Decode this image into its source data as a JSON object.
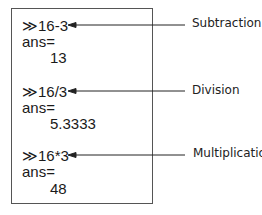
{
  "blocks": [
    {
      "command": "≫16-3",
      "ans_label": "ans=",
      "value": "13",
      "annotation": "Subtraction"
    },
    {
      "command": "≫16/3",
      "ans_label": "ans=",
      "value": "5.3333",
      "annotation": "Division"
    },
    {
      "command": "≫16*3",
      "ans_label": "ans=",
      "value": "48",
      "annotation": "Multiplication"
    }
  ]
}
